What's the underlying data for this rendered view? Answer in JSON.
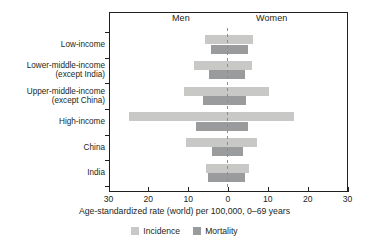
{
  "chart_data": {
    "type": "bar",
    "subtype": "population-pyramid",
    "title": "",
    "xlabel": "Age-standardized rate (world) per 100,000, 0–69 years",
    "ylabel": "",
    "xlim": [
      -30,
      30
    ],
    "xticks": [
      30,
      20,
      10,
      0,
      10,
      20,
      30
    ],
    "grid": false,
    "legend_position": "bottom",
    "side_labels": {
      "left": "Men",
      "right": "Women"
    },
    "categories": [
      "Low-income",
      "Lower-middle-income (except India)",
      "Upper-middle-income (except China)",
      "High-income",
      "China",
      "India"
    ],
    "category_label_lines": [
      [
        "Low-income"
      ],
      [
        "Lower-middle-income",
        "(except India)"
      ],
      [
        "Upper-middle-income",
        "(except China)"
      ],
      [
        "High-income"
      ],
      [
        "China"
      ],
      [
        "India"
      ]
    ],
    "series": [
      {
        "name": "Incidence",
        "side": "Men",
        "color": "#c8c9c7",
        "values": [
          5.8,
          8.5,
          11.1,
          24.8,
          10.5,
          5.5
        ]
      },
      {
        "name": "Incidence",
        "side": "Women",
        "color": "#c8c9c7",
        "values": [
          6.3,
          6.0,
          10.2,
          16.6,
          7.3,
          5.3
        ]
      },
      {
        "name": "Mortality",
        "side": "Men",
        "color": "#9a9b9c",
        "values": [
          4.3,
          4.8,
          6.2,
          8.0,
          4.0,
          5.0
        ]
      },
      {
        "name": "Mortality",
        "side": "Women",
        "color": "#9a9b9c",
        "values": [
          5.0,
          4.3,
          4.6,
          5.0,
          3.8,
          4.3
        ]
      }
    ],
    "legend": [
      {
        "label": "Incidence",
        "color": "#c8c9c7"
      },
      {
        "label": "Mortality",
        "color": "#9a9b9c"
      }
    ]
  },
  "colors": {
    "incidence": "#c8c9c7",
    "mortality": "#9a9b9c",
    "axis": "#231f20",
    "center_line": "#8d8e90",
    "background": "#ffffff"
  }
}
